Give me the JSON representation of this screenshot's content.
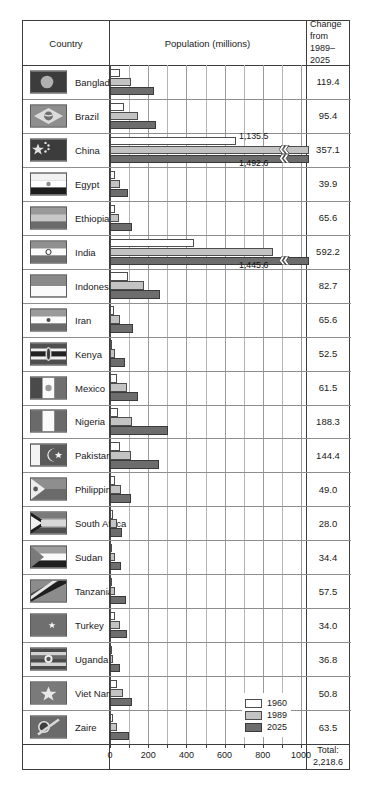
{
  "header": {
    "country": "Country",
    "population": "Population (millions)",
    "change_line1": "Change",
    "change_line2": "from",
    "change_line3": "1989–2025"
  },
  "legend": {
    "position": "inside-bottom-right",
    "items": [
      {
        "label": "1960",
        "color": "#ffffff"
      },
      {
        "label": "1989",
        "color": "#c3c3c3"
      },
      {
        "label": "2025",
        "color": "#6d6d6d"
      }
    ]
  },
  "axis": {
    "ticks": [
      0,
      100,
      200,
      300,
      400,
      500,
      600,
      700,
      800,
      900,
      1000
    ],
    "labeled_ticks": [
      {
        "value": 0,
        "label": "0"
      },
      {
        "value": 200,
        "label": "200"
      },
      {
        "value": 400,
        "label": "400"
      },
      {
        "value": 600,
        "label": "600"
      },
      {
        "value": 800,
        "label": "800"
      },
      {
        "value": 1000,
        "label": "1000"
      }
    ],
    "min": 0,
    "max": 1000
  },
  "total": {
    "label": "Total:",
    "value": "2,218.6"
  },
  "chart_data": {
    "type": "bar",
    "orientation": "horizontal",
    "title": "Population (millions)",
    "xlabel": "Population (millions)",
    "ylabel": "Country",
    "xlim": [
      0,
      1000
    ],
    "grid": true,
    "legend_position": "inside-bottom-right",
    "categories": [
      "Bangladesh",
      "Brazil",
      "China",
      "Egypt",
      "Ethiopia",
      "India",
      "Indonesia",
      "Iran",
      "Kenya",
      "Mexico",
      "Nigeria",
      "Pakistan",
      "Philippines",
      "South Africa",
      "Sudan",
      "Tanzania",
      "Turkey",
      "Uganda",
      "Viet Nam",
      "Zaire"
    ],
    "series": [
      {
        "name": "1960",
        "color": "#ffffff",
        "values": [
          51.4,
          72.6,
          657.5,
          25.9,
          24.2,
          442.3,
          96.2,
          21.6,
          8.1,
          36.5,
          42.3,
          49.9,
          27.6,
          17.4,
          11.2,
          10.1,
          27.5,
          7.3,
          34.7,
          15.3
        ]
      },
      {
        "name": "1989",
        "color": "#c3c3c3",
        "values": [
          110.1,
          147.4,
          1135.5,
          51.9,
          48.9,
          853.4,
          179.1,
          54.2,
          24.1,
          86.7,
          113.0,
          110.4,
          60.1,
          34.9,
          24.5,
          25.6,
          54.9,
          17.8,
          66.0,
          34.5
        ]
      },
      {
        "name": "2025",
        "color": "#6d6d6d",
        "values": [
          229.5,
          242.8,
          1492.6,
          91.8,
          114.5,
          1445.6,
          261.8,
          119.8,
          76.6,
          148.2,
          301.3,
          254.8,
          109.1,
          62.9,
          58.9,
          83.1,
          88.9,
          54.6,
          116.8,
          98.0
        ]
      }
    ],
    "broken_bars": [
      {
        "category": "China",
        "series": "1989",
        "value": 1135.5,
        "label": "1,135.5"
      },
      {
        "category": "China",
        "series": "2025",
        "value": 1492.6,
        "label": "1,492.6"
      },
      {
        "category": "India",
        "series": "2025",
        "value": 1445.6,
        "label": "1,445.6"
      }
    ],
    "change_column": {
      "header": "Change from 1989–2025",
      "values": [
        "119.4",
        "95.4",
        "357.1",
        "39.9",
        "65.6",
        "592.2",
        "82.7",
        "65.6",
        "52.5",
        "61.5",
        "188.3",
        "144.4",
        "49.0",
        "28.0",
        "34.4",
        "57.5",
        "34.0",
        "36.8",
        "50.8",
        "63.5"
      ]
    }
  },
  "rows": [
    {
      "country": "Bangladesh",
      "change": "119.4",
      "flag": "flag-bangladesh"
    },
    {
      "country": "Brazil",
      "change": "95.4",
      "flag": "flag-brazil"
    },
    {
      "country": "China",
      "change": "357.1",
      "flag": "flag-china"
    },
    {
      "country": "Egypt",
      "change": "39.9",
      "flag": "flag-egypt"
    },
    {
      "country": "Ethiopia",
      "change": "65.6",
      "flag": "flag-ethiopia"
    },
    {
      "country": "India",
      "change": "592.2",
      "flag": "flag-india"
    },
    {
      "country": "Indonesia",
      "change": "82.7",
      "flag": "flag-indonesia"
    },
    {
      "country": "Iran",
      "change": "65.6",
      "flag": "flag-iran"
    },
    {
      "country": "Kenya",
      "change": "52.5",
      "flag": "flag-kenya"
    },
    {
      "country": "Mexico",
      "change": "61.5",
      "flag": "flag-mexico"
    },
    {
      "country": "Nigeria",
      "change": "188.3",
      "flag": "flag-nigeria"
    },
    {
      "country": "Pakistan",
      "change": "144.4",
      "flag": "flag-pakistan"
    },
    {
      "country": "Philippines",
      "change": "49.0",
      "flag": "flag-philippines"
    },
    {
      "country": "South Africa",
      "change": "28.0",
      "flag": "flag-south-africa"
    },
    {
      "country": "Sudan",
      "change": "34.4",
      "flag": "flag-sudan"
    },
    {
      "country": "Tanzania",
      "change": "57.5",
      "flag": "flag-tanzania"
    },
    {
      "country": "Turkey",
      "change": "34.0",
      "flag": "flag-turkey"
    },
    {
      "country": "Uganda",
      "change": "36.8",
      "flag": "flag-uganda"
    },
    {
      "country": "Viet Nam",
      "change": "50.8",
      "flag": "flag-viet-nam"
    },
    {
      "country": "Zaire",
      "change": "63.5",
      "flag": "flag-zaire"
    }
  ]
}
